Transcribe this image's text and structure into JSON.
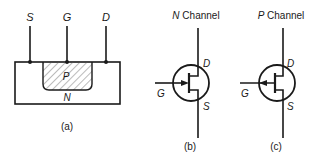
{
  "figure": {
    "panel_a": {
      "caption": "(a)",
      "terminals": {
        "source": "S",
        "gate": "G",
        "drain": "D"
      },
      "regions": {
        "p_region": "P",
        "n_substrate": "N"
      }
    },
    "panel_b": {
      "caption": "(b)",
      "title_letter": "N",
      "title_rest": " Channel",
      "terminals": {
        "drain": "D",
        "gate": "G",
        "source": "S"
      },
      "arrow_direction": "in"
    },
    "panel_c": {
      "caption": "(c)",
      "title_letter": "P",
      "title_rest": " Channel",
      "terminals": {
        "drain": "D",
        "gate": "G",
        "source": "S"
      },
      "arrow_direction": "out"
    },
    "colors": {
      "ink": "#1a1a1a",
      "background": "#ffffff"
    }
  }
}
